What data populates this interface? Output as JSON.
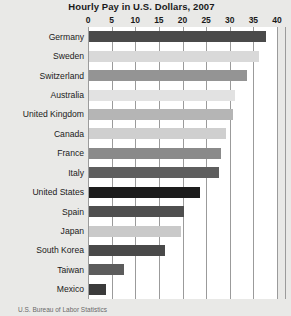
{
  "chart_data": {
    "type": "bar",
    "orientation": "horizontal",
    "title": "Hourly Pay in U.S. Dollars, 2007",
    "xlabel": "",
    "ylabel": "",
    "xlim": [
      0,
      40
    ],
    "xticks": [
      0,
      5,
      10,
      15,
      20,
      25,
      30,
      35,
      40
    ],
    "xtick_labels": [
      "0",
      "5",
      "10",
      "15",
      "20",
      "25",
      "30",
      "35",
      "40"
    ],
    "grid": true,
    "grid_axis": "x",
    "legend": false,
    "categories": [
      "Germany",
      "Sweden",
      "Switzerland",
      "Australia",
      "United Kingdom",
      "Canada",
      "France",
      "Italy",
      "United States",
      "Spain",
      "Japan",
      "South Korea",
      "Taiwan",
      "Mexico"
    ],
    "values": [
      37.5,
      36,
      33.5,
      31,
      30.5,
      29,
      28,
      27.5,
      23.5,
      20,
      19.5,
      16,
      7.5,
      3.5
    ],
    "bar_colors": [
      "#4a4a4a",
      "#d9d9d9",
      "#949494",
      "#e2e2e2",
      "#b5b5b5",
      "#cfcfcf",
      "#8a8a8a",
      "#5e5e5e",
      "#1c1c1c",
      "#4f4f4f",
      "#c9c9c9",
      "#494949",
      "#5c5c5c",
      "#3b3b3b"
    ],
    "plot_background": "#ffffff",
    "figure_background": "#e9e9e7",
    "gridline_color": "#9b9b9b",
    "text_color": "#1a1a1a"
  },
  "caption": {
    "text": "U.S. Bureau of Labor Statistics"
  }
}
